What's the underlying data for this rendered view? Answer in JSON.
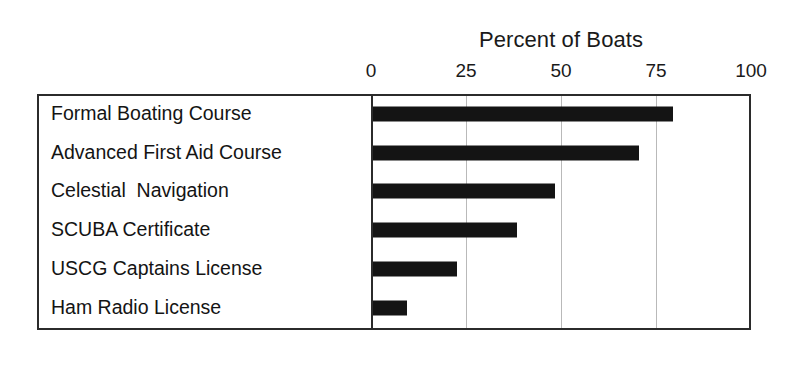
{
  "chart_data": {
    "type": "bar",
    "orientation": "horizontal",
    "title": "Percent of Boats",
    "xlabel": "",
    "ylabel": "",
    "categories": [
      "Formal Boating Course",
      "Advanced First Aid Course",
      "Celestial  Navigation",
      "SCUBA Certificate",
      "USCG Captains License",
      "Ham Radio License"
    ],
    "values": [
      79,
      70,
      48,
      38,
      22,
      9
    ],
    "xlim": [
      0,
      100
    ],
    "xticks": [
      0,
      25,
      50,
      75,
      100
    ],
    "xtick_labels": [
      "0",
      "25",
      "50",
      "75",
      "100"
    ],
    "grid": true,
    "grid_axis": "x",
    "legend": false,
    "bar_color": "#141414",
    "grid_color": "#b9b9b9",
    "frame_color": "#2b2b2b",
    "background_color": "#ffffff"
  }
}
